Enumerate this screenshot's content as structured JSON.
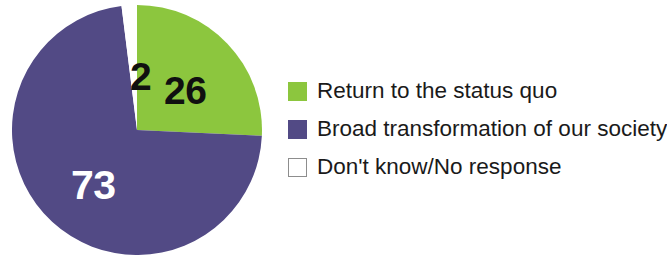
{
  "chart_data": {
    "type": "pie",
    "title": "",
    "subtitle": "",
    "xlabel": "",
    "ylabel": "",
    "grid": false,
    "legend_position": "right",
    "unit": "percent",
    "start_angle_deg": 0,
    "direction": "clockwise",
    "categories": [
      "Return to the status quo",
      "Broad transformation of our society",
      "Don't know/No response"
    ],
    "values": [
      26,
      73,
      2
    ],
    "colors": [
      "#8CC63E",
      "#524A85",
      "#FFFFFF"
    ],
    "data_labels": [
      "26",
      "73",
      "2"
    ],
    "slices": [
      {
        "label": "Return to the status quo",
        "value": 26,
        "display_value": "26",
        "color": "#8CC63E",
        "label_color": "#101010"
      },
      {
        "label": "Broad transformation of our society",
        "value": 73,
        "display_value": "73",
        "color": "#524A85",
        "label_color": "#FFFFFF"
      },
      {
        "label": "Don't know/No response",
        "value": 2,
        "display_value": "2",
        "color": "#FFFFFF",
        "label_color": "#101010"
      }
    ]
  },
  "legend": {
    "items": [
      {
        "label": "Return to the status quo",
        "color": "#8CC63E",
        "swatch": "filled-swatch-green"
      },
      {
        "label": "Broad transformation of our society",
        "color": "#524A85",
        "swatch": "filled-swatch-purple"
      },
      {
        "label": "Don't know/No response",
        "color": "#FFFFFF",
        "swatch": "outline-swatch-white"
      }
    ]
  },
  "theme": {
    "background": "#FFFFFF",
    "green": "#8CC63E",
    "purple": "#524A85",
    "white": "#FFFFFF",
    "swatch_border": "#8D8D8D",
    "text": "#1A1A1A"
  }
}
